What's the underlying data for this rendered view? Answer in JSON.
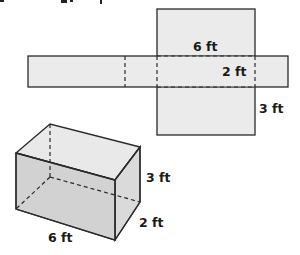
{
  "diagram": {
    "type": "rectangular-prism-net-and-solid",
    "colors": {
      "stroke": "#2a2a2a",
      "net_fill": "#ebebeb",
      "box_top": "#e9e9e9",
      "box_front": "#cdcdcd",
      "box_side": "#dadada",
      "label": "#1a1a1a"
    },
    "net": {
      "labels": {
        "length": "6 ft",
        "width": "2 ft",
        "height": "3 ft"
      }
    },
    "prism": {
      "labels": {
        "length": "6 ft",
        "width": "2 ft",
        "height": "3 ft"
      }
    }
  }
}
